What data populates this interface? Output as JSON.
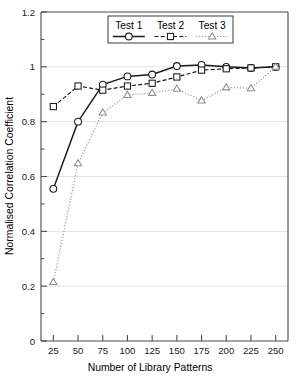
{
  "chart_data": {
    "type": "line",
    "title": "",
    "xlabel": "Number of Library Patterns",
    "ylabel": "Normalised Correlation Coefficient",
    "x": [
      25,
      50,
      75,
      100,
      125,
      150,
      175,
      200,
      225,
      250
    ],
    "xlim": [
      12.5,
      262.5
    ],
    "ylim": [
      0,
      1.2
    ],
    "xticks": [
      25,
      50,
      75,
      100,
      125,
      150,
      175,
      200,
      225,
      250
    ],
    "xticklabels": [
      "25",
      "50",
      "75",
      "100",
      "125",
      "150",
      "175",
      "200",
      "225",
      "250"
    ],
    "yticks": [
      0,
      0.2,
      0.4,
      0.6,
      0.8,
      1,
      1.2
    ],
    "yticklabels": [
      "0",
      "0.2",
      "0.4",
      "0.6",
      "0.8",
      "1",
      "1.2"
    ],
    "yminorticks": [
      0.1,
      0.3,
      0.5,
      0.7,
      0.9,
      1.1
    ],
    "grid": "horizontal-major",
    "legend_position": "top-center",
    "series": [
      {
        "name": "Test 1",
        "marker": "circle",
        "linestyle": "solid",
        "color": "#1a1a1a",
        "values": [
          0.555,
          0.8,
          0.935,
          0.965,
          0.972,
          1.003,
          1.007,
          1.0,
          0.996,
          1.0
        ]
      },
      {
        "name": "Test 2",
        "marker": "square",
        "linestyle": "dashed",
        "color": "#1a1a1a",
        "values": [
          0.855,
          0.93,
          0.915,
          0.93,
          0.94,
          0.963,
          0.988,
          0.993,
          0.996,
          1.0
        ]
      },
      {
        "name": "Test 3",
        "marker": "triangle",
        "linestyle": "dotted",
        "color": "#8f8f8f",
        "values": [
          0.215,
          0.648,
          0.833,
          0.897,
          0.905,
          0.92,
          0.877,
          0.925,
          0.922,
          1.0
        ]
      }
    ]
  },
  "legend": {
    "entries": [
      {
        "label": "Test 1"
      },
      {
        "label": "Test 2"
      },
      {
        "label": "Test 3"
      }
    ]
  },
  "axes": {
    "x_title": "Number of Library Patterns",
    "y_title": "Normalised Correlation Coefficient"
  }
}
